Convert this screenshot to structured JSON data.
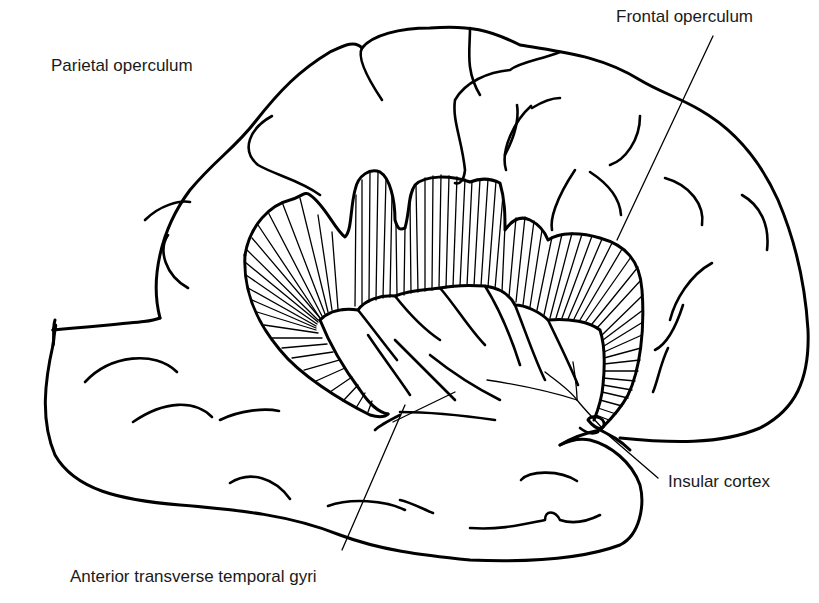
{
  "figure": {
    "background_color": "#ffffff",
    "line_color": "#000000",
    "text_color": "#1a1a1a"
  },
  "labels": {
    "parietal_operculum": "Parietal operculum",
    "frontal_operculum": "Frontal operculum",
    "insular_cortex": "Insular cortex",
    "anterior_transverse_temporal_gyri": "Anterior transverse temporal gyri"
  }
}
